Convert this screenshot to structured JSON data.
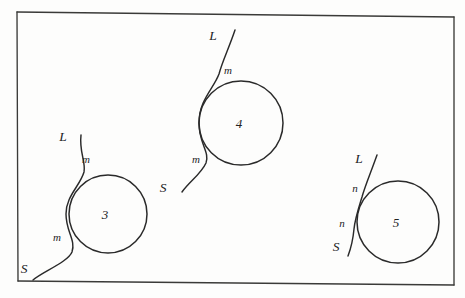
{
  "diagram": {
    "background_color": "#fdfdfc",
    "ink_color": "#2a2a2a",
    "frame": {
      "label": "diagram border",
      "corners": "17,12 454,17 454,285 18,281"
    },
    "figures": [
      {
        "number": "3",
        "circle": {
          "cx": 108,
          "cy": 214,
          "r": 39
        },
        "line": {
          "type": "deflected-tangent",
          "start_label": "L",
          "end_label": "S",
          "start_label_pos": {
            "x": 63,
            "y": 141
          },
          "end_label_pos": {
            "x": 24,
            "y": 273
          },
          "contact_labels": [
            "m",
            "m"
          ],
          "contact_label_pos": [
            {
              "x": 86,
              "y": 163
            },
            {
              "x": 57,
              "y": 241
            }
          ],
          "path": "M 81 135 C 79 152, 86 162, 84 172 C 80 186, 66 196, 66 214 C 66 232, 76 240, 72 252 C 68 262, 42 272, 33 280"
        }
      },
      {
        "number": "4",
        "circle": {
          "cx": 241,
          "cy": 123,
          "r": 42
        },
        "line": {
          "type": "deflected-tangent",
          "start_label": "L",
          "end_label": "S",
          "start_label_pos": {
            "x": 213,
            "y": 40
          },
          "end_label_pos": {
            "x": 163,
            "y": 192
          },
          "contact_labels": [
            "m",
            "m"
          ],
          "contact_label_pos": [
            {
              "x": 228,
              "y": 74
            },
            {
              "x": 196,
              "y": 163
            }
          ],
          "path": "M 235 30 C 229 48, 222 62, 219 74 C 214 88, 199 100, 199 123 C 199 144, 210 152, 206 163 C 201 174, 189 182, 182 192"
        }
      },
      {
        "number": "5",
        "circle": {
          "cx": 398,
          "cy": 222,
          "r": 41
        },
        "line": {
          "type": "secant",
          "start_label": "L",
          "end_label": "S",
          "start_label_pos": {
            "x": 359,
            "y": 163
          },
          "end_label_pos": {
            "x": 336,
            "y": 251
          },
          "contact_labels": [
            "n",
            "n"
          ],
          "contact_label_pos": [
            {
              "x": 355,
              "y": 192
            },
            {
              "x": 342,
              "y": 227
            }
          ],
          "path": "M 377 155 C 371 172, 365 186, 362 197 C 358 210, 355 219, 354 229 C 353 240, 351 248, 348 256"
        }
      }
    ]
  }
}
